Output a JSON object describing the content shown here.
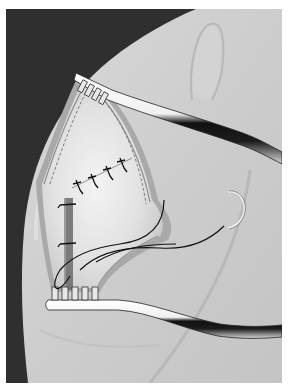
{
  "figure": {
    "alt": "Shoulder incision with retractors and sutures"
  },
  "colors": {
    "background_dark": "#2e2e2e",
    "skin": "#cfcfcf",
    "skin_light": "#dcdcdc",
    "skin_shadow": "#b4b4b4",
    "tissue": "#e6e6e6",
    "retractor": "#f4f4f4",
    "suture": "#111111",
    "page": "#ffffff"
  },
  "elements": {
    "incision_label": "surgical-incision",
    "top_retractor_label": "upper-retractor",
    "bottom_retractor_label": "lower-retractor",
    "sutures_count": 4,
    "vertical_sutures_count": 2,
    "needle_label": "curved-needle"
  }
}
